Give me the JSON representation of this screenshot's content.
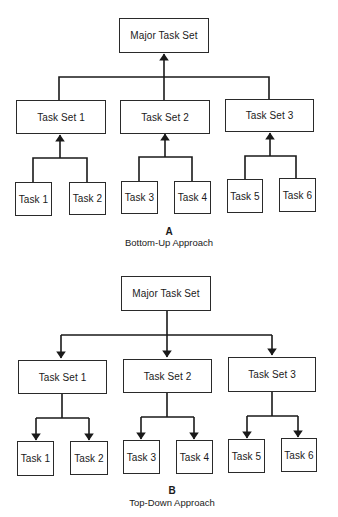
{
  "diagrams": [
    {
      "id": "A",
      "label": "A",
      "title": "Bottom-Up Approach",
      "arrow_direction": "up",
      "root": "Major Task Set",
      "task_sets": [
        {
          "label": "Task Set 1",
          "tasks": [
            "Task 1",
            "Task 2"
          ]
        },
        {
          "label": "Task Set 2",
          "tasks": [
            "Task 3",
            "Task 4"
          ]
        },
        {
          "label": "Task Set 3",
          "tasks": [
            "Task 5",
            "Task 6"
          ]
        }
      ]
    },
    {
      "id": "B",
      "label": "B",
      "title": "Top-Down Approach",
      "arrow_direction": "down",
      "root": "Major Task Set",
      "task_sets": [
        {
          "label": "Task Set 1",
          "tasks": [
            "Task 1",
            "Task 2"
          ]
        },
        {
          "label": "Task Set 2",
          "tasks": [
            "Task 3",
            "Task 4"
          ]
        },
        {
          "label": "Task Set 3",
          "tasks": [
            "Task 5",
            "Task 6"
          ]
        }
      ]
    }
  ],
  "colors": {
    "line": "#1a1a1a",
    "background": "#ffffff"
  }
}
